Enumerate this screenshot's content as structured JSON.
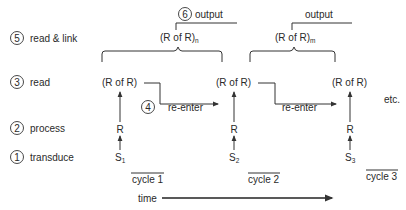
{
  "stages": [
    {
      "num": "5",
      "label": "read & link"
    },
    {
      "num": "3",
      "label": "read"
    },
    {
      "num": "2",
      "label": "process"
    },
    {
      "num": "1",
      "label": "transduce"
    }
  ],
  "cycles": [
    {
      "label": "cycle  1",
      "stimulus": "S",
      "stimulus_sub": "1",
      "process": "R",
      "read": "(R of R)"
    },
    {
      "label": "cycle  2",
      "stimulus": "S",
      "stimulus_sub": "2",
      "process": "R",
      "read": "(R of R)"
    },
    {
      "label": "cycle  3",
      "stimulus": "S",
      "stimulus_sub": "3",
      "process": "R",
      "read": "(R of R)"
    }
  ],
  "links": [
    {
      "label": "(R of R)",
      "sub": "n",
      "output_num": "6",
      "output_label": "output"
    },
    {
      "label": "(R of R)",
      "sub": "m",
      "output_label": "output"
    }
  ],
  "reenter": [
    {
      "num": "4",
      "label": "re-enter"
    },
    {
      "label": "re-enter"
    }
  ],
  "etc": "etc.",
  "time_label": "time"
}
